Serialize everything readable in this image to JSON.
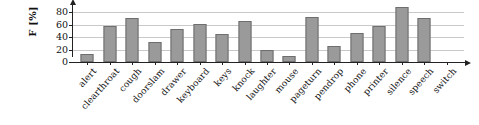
{
  "chart_data": {
    "type": "bar",
    "title": "",
    "xlabel": "",
    "ylabel": "F [%]",
    "ylim": [
      0,
      80
    ],
    "yticks": [
      0,
      20,
      40,
      60,
      80
    ],
    "grid": true,
    "legend": false,
    "categories": [
      "alert",
      "clearthroat",
      "cough",
      "doorslam",
      "drawer",
      "keyboard",
      "keys",
      "knock",
      "laughter",
      "mouse",
      "pageturn",
      "pendrop",
      "phone",
      "printer",
      "silence",
      "speech",
      "switch"
    ],
    "values": [
      13,
      57,
      71,
      32,
      53,
      61,
      45,
      66,
      20,
      9,
      72,
      25,
      46,
      58,
      88,
      70,
      0
    ],
    "bar_color": "#9a9a9a",
    "bar_edge_color": "#6e6e6e",
    "grid_color": "#c9c9c9",
    "axis_color": "#222222"
  }
}
